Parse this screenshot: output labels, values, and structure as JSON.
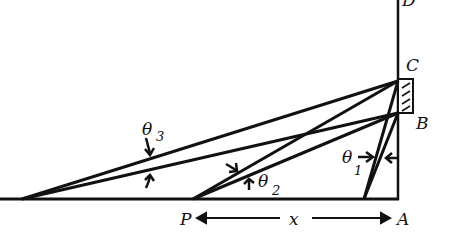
{
  "labels": {
    "D": "D",
    "C": "C",
    "B": "B",
    "A": "A",
    "P": "P",
    "x": "x",
    "theta": "θ",
    "sub1": "1",
    "sub2": "2",
    "sub3": "3"
  },
  "colors": {
    "ink": "#111111",
    "background": "#ffffff"
  }
}
